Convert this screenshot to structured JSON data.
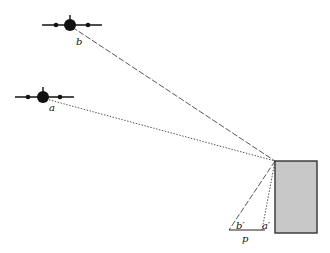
{
  "diagram": {
    "labels": {
      "plane_b": "b",
      "plane_a": "a",
      "image_b": "b′",
      "image_a": "a′",
      "image_plane": "p"
    },
    "colors": {
      "ink": "#111111",
      "box_fill": "#c8c8c8",
      "box_stroke": "#333333"
    }
  }
}
